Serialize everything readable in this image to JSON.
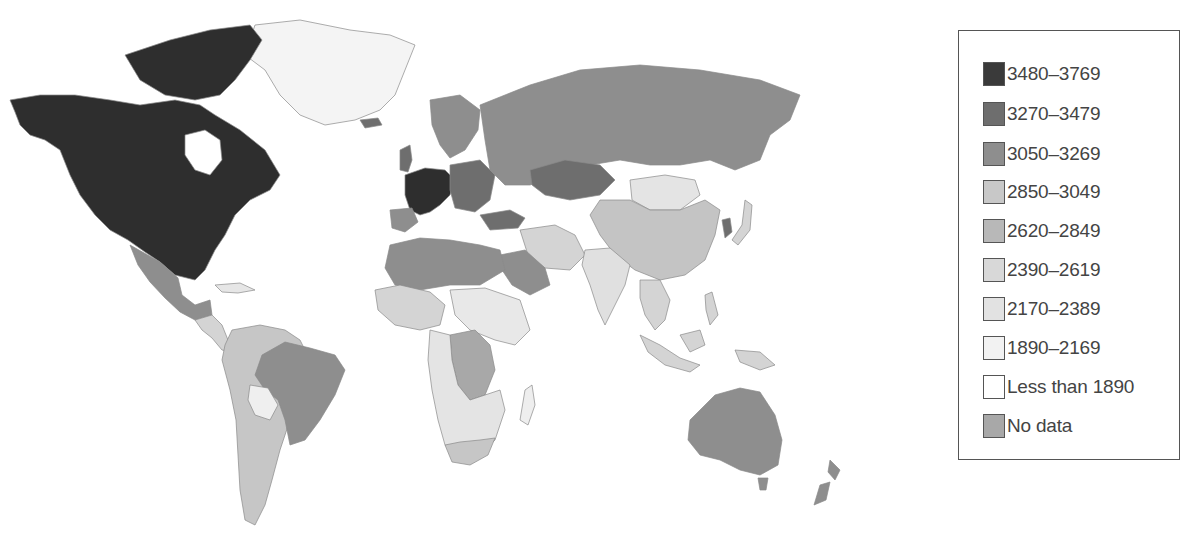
{
  "map": {
    "type": "choropleth",
    "subject": "world countries shaded by category",
    "legend": {
      "items": [
        {
          "label": "3480–3769",
          "color": "#3a3a3a"
        },
        {
          "label": "3270–3479",
          "color": "#6e6e6e"
        },
        {
          "label": "3050–3269",
          "color": "#8e8e8e"
        },
        {
          "label": "2850–3049",
          "color": "#bdbdbd"
        },
        {
          "label": "2620–2849",
          "color": "#b3b3b3"
        },
        {
          "label": "2390–2619",
          "color": "#d4d4d4"
        },
        {
          "label": "2170–2389",
          "color": "#dedede"
        },
        {
          "label": "1890–2169",
          "color": "#efefef"
        },
        {
          "label": "Less than 1890",
          "color": "#ffffff"
        },
        {
          "label": "No data",
          "color": "#a8a8a8"
        }
      ]
    },
    "regions": [
      {
        "name": "North America (USA/Canada)",
        "category": "3480–3769"
      },
      {
        "name": "Greenland",
        "category": "1890–2169"
      },
      {
        "name": "Mexico",
        "category": "3050–3269"
      },
      {
        "name": "Central America",
        "category": "2390–2619"
      },
      {
        "name": "Brazil",
        "category": "3050–3269"
      },
      {
        "name": "Argentina/Chile",
        "category": "2620–2849"
      },
      {
        "name": "Bolivia",
        "category": "1890–2169"
      },
      {
        "name": "Western Europe",
        "category": "3480–3769"
      },
      {
        "name": "Russia",
        "category": "3050–3269"
      },
      {
        "name": "Kazakhstan",
        "category": "3270–3479"
      },
      {
        "name": "North Africa",
        "category": "3050–3269"
      },
      {
        "name": "Sub-Saharan Africa",
        "category": "2170–2389"
      },
      {
        "name": "Central Africa (DRC)",
        "category": "No data"
      },
      {
        "name": "Middle East",
        "category": "2390–2619"
      },
      {
        "name": "India",
        "category": "2170–2389"
      },
      {
        "name": "China",
        "category": "2850–3049"
      },
      {
        "name": "Mongolia",
        "category": "2170–2389"
      },
      {
        "name": "Southeast Asia",
        "category": "2390–2619"
      },
      {
        "name": "Australia",
        "category": "3050–3269"
      },
      {
        "name": "New Zealand",
        "category": "3050–3269"
      }
    ]
  }
}
